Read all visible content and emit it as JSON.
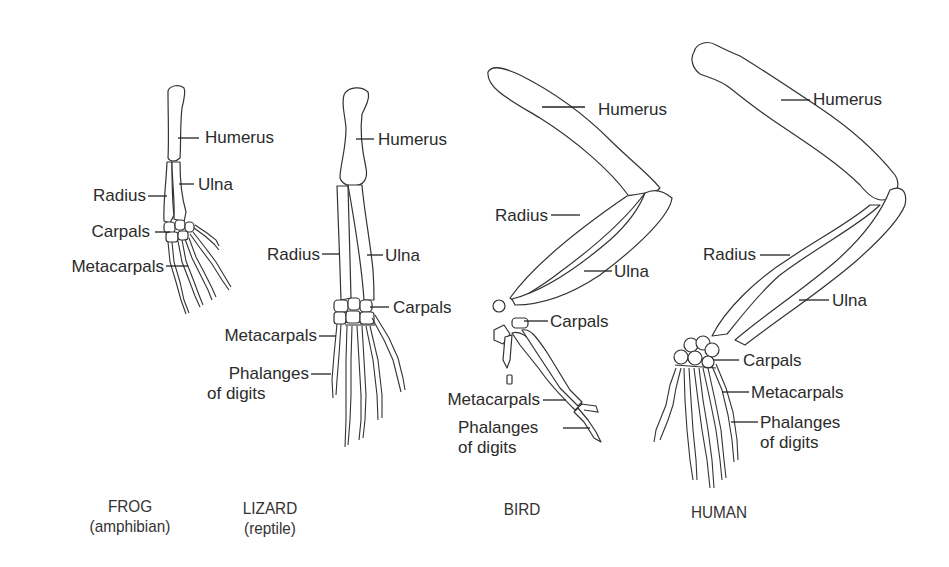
{
  "diagram": {
    "type": "homologous-forelimb-comparison",
    "organisms": [
      {
        "name": "FROG",
        "group": "(amphibian)",
        "labels": {
          "humerus": "Humerus",
          "ulna": "Ulna",
          "radius": "Radius",
          "carpals": "Carpals",
          "metacarpals": "Metacarpals"
        }
      },
      {
        "name": "LIZARD",
        "group": "(reptile)",
        "labels": {
          "humerus": "Humerus",
          "radius": "Radius",
          "ulna": "Ulna",
          "carpals": "Carpals",
          "metacarpals": "Metacarpals",
          "phalanges_line1": "Phalanges",
          "phalanges_line2": "of digits"
        }
      },
      {
        "name": "BIRD",
        "group": "",
        "labels": {
          "humerus": "Humerus",
          "radius": "Radius",
          "ulna": "Ulna",
          "carpals": "Carpals",
          "metacarpals": "Metacarpals",
          "phalanges_line1": "Phalanges",
          "phalanges_line2": "of digits"
        }
      },
      {
        "name": "HUMAN",
        "group": "",
        "labels": {
          "humerus": "Humerus",
          "radius": "Radius",
          "ulna": "Ulna",
          "carpals": "Carpals",
          "metacarpals": "Metacarpals",
          "phalanges_line1": "Phalanges",
          "phalanges_line2": "of digits"
        }
      }
    ]
  }
}
